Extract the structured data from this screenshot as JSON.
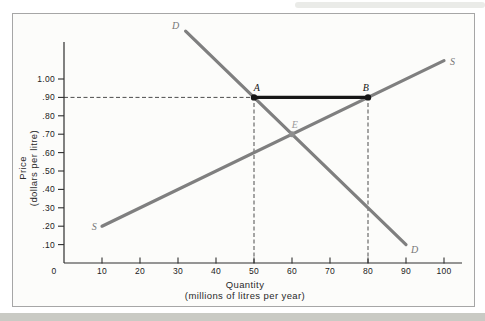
{
  "figure": {
    "xlabel_line1": "Quantity",
    "xlabel_line2": "(millions of litres per year)",
    "ylabel_line1": "Price",
    "ylabel_line2": "(dollars per litre)"
  },
  "chart_data": {
    "type": "line",
    "subtype": "supply-demand-diagram",
    "title": "",
    "xlabel": "Quantity (millions of litres per year)",
    "ylabel": "Price (dollars per litre)",
    "xlim": [
      0,
      105
    ],
    "ylim": [
      0,
      1.2
    ],
    "grid": false,
    "legend": "none",
    "origin_label": "0",
    "x_ticks": {
      "values": [
        10,
        20,
        30,
        40,
        50,
        60,
        70,
        80,
        90,
        100
      ],
      "labels": [
        "10",
        "20",
        "30",
        "40",
        "50",
        "60",
        "70",
        "80",
        "90",
        "100"
      ]
    },
    "y_ticks": {
      "values": [
        0.1,
        0.2,
        0.3,
        0.4,
        0.5,
        0.6,
        0.7,
        0.8,
        0.9,
        1.0
      ],
      "labels": [
        ".10",
        ".20",
        ".30",
        ".40",
        ".50",
        ".60",
        ".70",
        ".80",
        ".90",
        "1.00"
      ]
    },
    "series": [
      {
        "name": "demand",
        "label": "D",
        "color": "#7f7f7f",
        "points": [
          [
            32,
            1.26
          ],
          [
            50,
            0.9
          ],
          [
            60,
            0.7
          ],
          [
            80,
            0.3
          ],
          [
            90,
            0.1
          ]
        ]
      },
      {
        "name": "supply",
        "label": "S",
        "color": "#7f7f7f",
        "points": [
          [
            10,
            0.2
          ],
          [
            60,
            0.7
          ],
          [
            80,
            0.9
          ],
          [
            100,
            1.1
          ]
        ]
      }
    ],
    "price_floor_segment": {
      "y": 0.9,
      "x_from": 50,
      "x_to": 80,
      "color": "#161616"
    },
    "marked_points": [
      {
        "label": "A",
        "x": 50,
        "y": 0.9,
        "color": "#161616",
        "label_color": "#161616"
      },
      {
        "label": "B",
        "x": 80,
        "y": 0.9,
        "color": "#161616",
        "label_color": "#161616"
      },
      {
        "label": "E",
        "x": 60,
        "y": 0.7,
        "color": "#8f8f8f",
        "label_color": "#9a9a9a"
      }
    ],
    "dashed_guides": [
      {
        "orientation": "horizontal",
        "y": 0.9,
        "x_from": 0,
        "x_to": 50
      },
      {
        "orientation": "vertical",
        "x": 50,
        "y_from": 0,
        "y_to": 0.9
      },
      {
        "orientation": "vertical",
        "x": 80,
        "y_from": 0,
        "y_to": 0.9
      }
    ],
    "colors": {
      "axis": "#2e2e2e",
      "tick_text": "#222222",
      "curve": "#7f7f7f",
      "curve_label": "#767676",
      "dashed": "#4d4d4d",
      "floor": "#161616",
      "border": "#a6a6a6"
    }
  }
}
